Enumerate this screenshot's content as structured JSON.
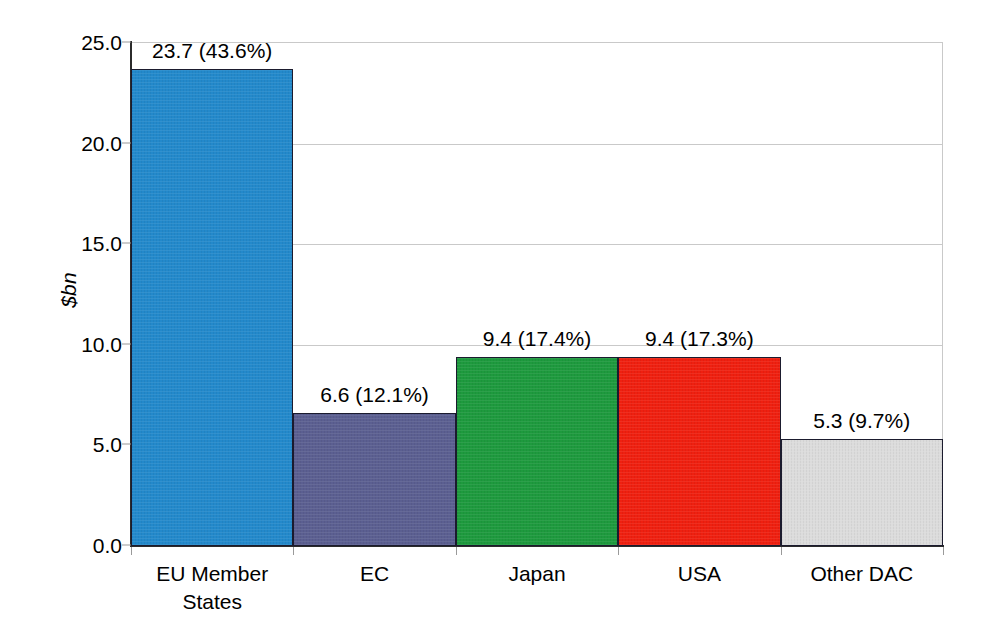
{
  "chart_data": {
    "type": "bar",
    "title": "",
    "subtitle": "",
    "xlabel": "",
    "ylabel": "$bn",
    "ylim": [
      0,
      25
    ],
    "ytick_labels": [
      "0.0",
      "5.0",
      "10.0",
      "15.0",
      "20.0",
      "25.0"
    ],
    "ytick_values": [
      0,
      5,
      10,
      15,
      20,
      25
    ],
    "grid": true,
    "legend": "none",
    "categories": [
      "EU Member\nStates",
      "EC",
      "Japan",
      "USA",
      "Other DAC"
    ],
    "values": [
      23.7,
      6.6,
      9.4,
      9.4,
      5.3
    ],
    "shares": [
      "43.6%",
      "12.1%",
      "17.4%",
      "17.3%",
      "9.7%"
    ],
    "data_labels": [
      "23.7 (43.6%)",
      "6.6 (12.1%)",
      "9.4 (17.4%)",
      "9.4 (17.3%)",
      "5.3 (9.7%)"
    ],
    "bar_colors": [
      "#2389cb",
      "#5b5f91",
      "#1e9a3e",
      "#ef2010",
      "#dcdcdc"
    ],
    "bar_edge_color": "#1b1b2e",
    "grid_color": "#c9c9c9",
    "axis_color": "#2b2b2b"
  },
  "bars": [
    {
      "category": "EU Member\nStates",
      "value": 23.7,
      "share": "43.6%",
      "label": "23.7 (43.6%)",
      "color": "#2389cb",
      "name": "bar-eu-member-states"
    },
    {
      "category": "EC",
      "value": 6.6,
      "share": "12.1%",
      "label": "6.6 (12.1%)",
      "color": "#5b5f91",
      "name": "bar-ec"
    },
    {
      "category": "Japan",
      "value": 9.4,
      "share": "17.4%",
      "label": "9.4 (17.4%)",
      "color": "#1e9a3e",
      "name": "bar-japan"
    },
    {
      "category": "USA",
      "value": 9.4,
      "share": "17.3%",
      "label": "9.4 (17.3%)",
      "color": "#ef2010",
      "name": "bar-usa"
    },
    {
      "category": "Other DAC",
      "value": 5.3,
      "share": "9.7%",
      "label": "5.3 (9.7%)",
      "color": "#dcdcdc",
      "name": "bar-other-dac"
    }
  ]
}
